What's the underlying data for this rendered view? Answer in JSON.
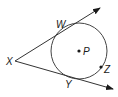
{
  "diagram": {
    "type": "circle-with-tangents",
    "circle": {
      "center_label": "P",
      "cx": 79,
      "cy": 51,
      "r": 28
    },
    "external_point": {
      "label": "X",
      "x": 15,
      "y": 61
    },
    "tangent_points": [
      {
        "label": "W",
        "x": 64,
        "y": 27
      },
      {
        "label": "Y",
        "x": 70,
        "y": 77
      }
    ],
    "point_on_circle": {
      "label": "Z",
      "x": 101,
      "y": 67
    },
    "rays": [
      {
        "from": "X",
        "through": "W",
        "end_x": 100,
        "end_y": 8
      },
      {
        "from": "X",
        "through": "Y",
        "end_x": 113,
        "end_y": 89
      }
    ],
    "colors": {
      "stroke": "#333333",
      "text": "#1a1a1a"
    }
  }
}
